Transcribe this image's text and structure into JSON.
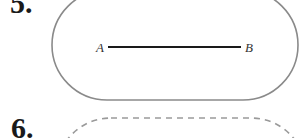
{
  "problems": [
    {
      "number": "5.",
      "figure": {
        "shape": "stadium",
        "outline": "solid",
        "outline_color": "#8a8a8a",
        "segment": {
          "start_label": "A",
          "end_label": "B",
          "color": "#1a1a1a"
        }
      }
    },
    {
      "number": "6.",
      "figure": {
        "shape": "stadium",
        "outline": "dashed",
        "outline_color": "#9a9a9a"
      }
    }
  ]
}
